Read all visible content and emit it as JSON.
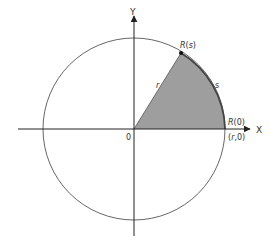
{
  "figure": {
    "colors": {
      "background": "#ffffff",
      "circle": "#555555",
      "axis": "#222222",
      "sector_fill": "#9e9e9e",
      "arc_highlight": "#444444",
      "text": "#333333"
    },
    "axes": {
      "x_label": "X",
      "y_label": "Y",
      "origin_label": "0"
    },
    "points": {
      "start": {
        "label_prefix": "R",
        "label_arg": "0"
      },
      "end": {
        "label_prefix": "R",
        "label_arg": "s"
      },
      "start_coords": {
        "open": "(",
        "r": "r",
        "sep": ",0",
        "close": ")"
      }
    },
    "segments": {
      "radius_label": "r",
      "arc_label": "s"
    }
  }
}
